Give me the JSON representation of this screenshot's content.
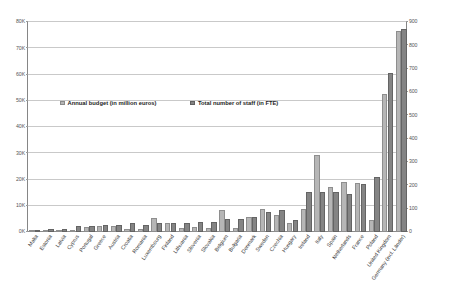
{
  "chart_data": {
    "type": "bar",
    "title": "",
    "subtitle": "",
    "xlabel": "",
    "ylabel": "",
    "y2label": "",
    "grid": true,
    "legend_position": "inside-upper-left",
    "categories": [
      "Malta",
      "Estonia",
      "Latvia",
      "Cyprus",
      "Portugal",
      "Greece",
      "Austria",
      "Croatia",
      "Romania",
      "Luxembourg",
      "Finland",
      "Lithuania",
      "Slovenia",
      "Slovakia",
      "Belgium",
      "Bulgaria",
      "Denmark",
      "Sweden",
      "Czechia",
      "Hungary",
      "Ireland",
      "Italy",
      "Spain",
      "Netherlands",
      "France",
      "Poland",
      "United Kingdom",
      "Germany (incl. Länder)"
    ],
    "series": [
      {
        "name": "Annual budget (in million euros)",
        "axis": "left",
        "unit": "million euros",
        "color": "#b6b6b6",
        "values": [
          600,
          700,
          900,
          700,
          2100,
          2200,
          2200,
          1200,
          1300,
          5500,
          3300,
          1400,
          2100,
          1700,
          8400,
          1500,
          5800,
          8800,
          6400,
          3600,
          8800,
          29200,
          17300,
          19200,
          18600,
          4500,
          52500,
          76500
        ]
      },
      {
        "name": "Total number of staff (in FTE)",
        "axis": "right",
        "unit": "FTE",
        "color": "#848484",
        "values": [
          10,
          13,
          14,
          24,
          24,
          31,
          32,
          37,
          30,
          38,
          37,
          39,
          41,
          43,
          56,
          57,
          63,
          84,
          95,
          52,
          170,
          170,
          170,
          163,
          205,
          235,
          680,
          870
        ]
      }
    ],
    "left_axis": {
      "min": 0,
      "max": 80000,
      "step": 10000,
      "ticks": [
        "0K",
        "10K",
        "20K",
        "30K",
        "40K",
        "50K",
        "60K",
        "70K",
        "80K"
      ]
    },
    "right_axis": {
      "min": 0,
      "max": 900,
      "step": 100,
      "ticks": [
        "0",
        "100",
        "200",
        "300",
        "400",
        "500",
        "600",
        "700",
        "800",
        "900"
      ]
    }
  },
  "legend": {
    "items": [
      {
        "label": "Annual budget (in million euros)",
        "swatch": "budget-swatch-icon"
      },
      {
        "label": "Total number of staff (in FTE)",
        "swatch": "staff-swatch-icon"
      }
    ]
  },
  "colors": {
    "budget_bar": "#b6b6b6",
    "staff_bar": "#848484",
    "gridline": "#c9c9c9",
    "axis": "#868686",
    "background": "#ffffff"
  }
}
